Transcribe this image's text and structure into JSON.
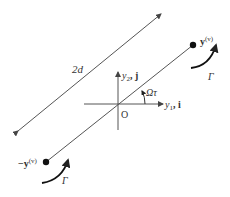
{
  "diagram": {
    "distance_label": "2d",
    "axis_y2_label": "y",
    "axis_y2_sub": "2",
    "axis_y2_vec": ", j",
    "axis_y1_label": "y",
    "axis_y1_sub": "1",
    "axis_y1_vec": ", i",
    "angle_label": "Ωτ",
    "origin_label": "O",
    "vortex_pos_label": "y",
    "vortex_pos_sup": "(v)",
    "vortex_neg_label": "−y",
    "vortex_neg_sup": "(v)",
    "circulation_top_label": "Γ",
    "circulation_bottom_label": "Γ",
    "colors": {
      "line": "#555555",
      "point": "#111111",
      "text": "#333333"
    }
  }
}
